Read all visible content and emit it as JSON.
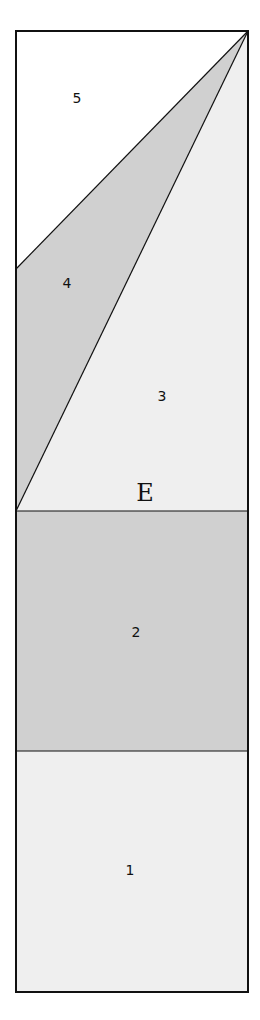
{
  "diagram": {
    "type": "region-partition",
    "frame": {
      "x1": 16,
      "y1": 31,
      "x2": 248,
      "y2": 992
    },
    "colors": {
      "white": "#ffffff",
      "light_gray": "#efefef",
      "mid_gray": "#d0d0d0",
      "stroke": "#111111"
    },
    "regions": [
      {
        "id": "1",
        "label": "1",
        "fill": "#efefef"
      },
      {
        "id": "2",
        "label": "2",
        "fill": "#d0d0d0"
      },
      {
        "id": "3",
        "label": "3",
        "fill": "#efefef"
      },
      {
        "id": "4",
        "label": "4",
        "fill": "#d0d0d0"
      },
      {
        "id": "5",
        "label": "5",
        "fill": "#ffffff"
      }
    ],
    "point_label": "E"
  }
}
